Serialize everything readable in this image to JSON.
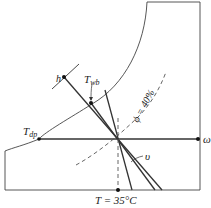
{
  "diagram": {
    "type": "psychrometric-chart-schematic",
    "labels": {
      "enthalpy": "h",
      "wet_bulb_main": "T",
      "wet_bulb_sub": "wb",
      "dew_point_main": "T",
      "dew_point_sub": "dp",
      "humidity_ratio": "ω",
      "relative_humidity": "ϕ = 40%",
      "specific_volume": "υ",
      "dry_bulb": "T = 35°C"
    },
    "colors": {
      "line": "#333333",
      "dashed": "#555555",
      "background": "#ffffff"
    }
  }
}
